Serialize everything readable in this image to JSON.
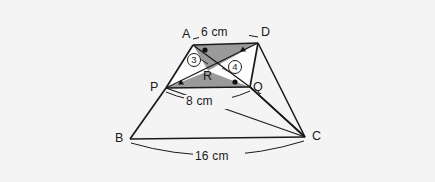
{
  "figure": {
    "background_color": "#f4f4f4",
    "line_color": "#1a1a1a",
    "shade_color": "#9a9a9a",
    "white_fill": "#ffffff"
  },
  "vertices": {
    "A": {
      "label": "A",
      "x": 193,
      "y": 45
    },
    "B": {
      "label": "B",
      "x": 130,
      "y": 139
    },
    "C": {
      "label": "C",
      "x": 305,
      "y": 137
    },
    "D": {
      "label": "D",
      "x": 258,
      "y": 43
    },
    "P": {
      "label": "P",
      "x": 166,
      "y": 88
    },
    "Q": {
      "label": "Q",
      "x": 250,
      "y": 87
    },
    "R": {
      "label": "R",
      "x": 208,
      "y": 71
    }
  },
  "measurements": {
    "top": "6 cm",
    "middle": "8 cm",
    "bottom": "16 cm"
  },
  "region_labels": {
    "left": "3",
    "right": "4"
  },
  "angle_markers": [
    {
      "name": "angle-marker-at-a",
      "glyph": "circle",
      "x": 205,
      "y": 50
    },
    {
      "name": "angle-marker-at-d",
      "glyph": "triangle",
      "x": 243,
      "y": 49
    },
    {
      "name": "angle-marker-at-p",
      "glyph": "triangle",
      "x": 180,
      "y": 83
    },
    {
      "name": "angle-marker-at-q",
      "glyph": "circle",
      "x": 235,
      "y": 82
    }
  ]
}
